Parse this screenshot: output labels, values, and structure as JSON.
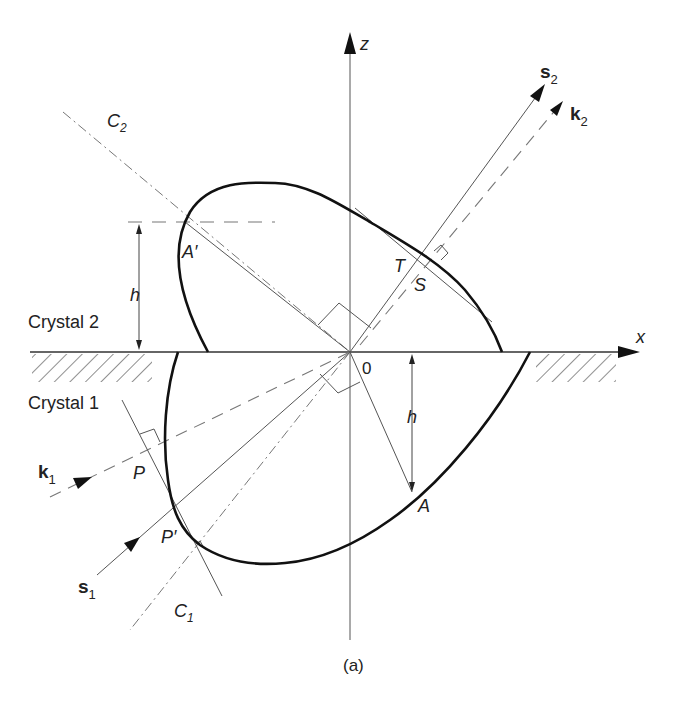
{
  "figure": {
    "caption": "(a)",
    "axes": {
      "z_label": "z",
      "x_label": "x",
      "origin_label": "0"
    },
    "regions": {
      "upper": "Crystal 2",
      "lower": "Crystal 1"
    },
    "vectors": {
      "s2": {
        "base": "s",
        "sub": "2"
      },
      "k2": {
        "base": "k",
        "sub": "2"
      },
      "s1": {
        "base": "s",
        "sub": "1"
      },
      "k1": {
        "base": "k",
        "sub": "1"
      }
    },
    "lines": {
      "c2": {
        "base": "C",
        "sub": "2"
      },
      "c1": {
        "base": "C",
        "sub": "1"
      }
    },
    "points": {
      "a_prime": "A′",
      "a": "A",
      "t": "T",
      "s": "S",
      "p": "P",
      "p_prime": "P′"
    },
    "dimensions": {
      "h_upper": "h",
      "h_lower": "h"
    },
    "colors": {
      "curve": "#111111",
      "line": "#555555",
      "text": "#222222",
      "background": "#ffffff"
    }
  }
}
